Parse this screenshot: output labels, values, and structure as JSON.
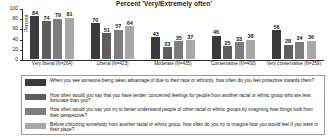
{
  "chart_data": {
    "type": "bar",
    "title": "Percent 'Very/Extremely often'",
    "xlabel": "",
    "ylabel": "Percent",
    "ylim": [
      0,
      100
    ],
    "yticks": [
      0,
      20,
      40,
      60,
      80,
      100
    ],
    "grid": false,
    "legend_position": "bottom",
    "categories": [
      "Very liberal (N=264)",
      "Liberal (N=423)",
      "Moderate (N=435)",
      "Conservative (N=400)",
      "Very conservative (N=259)"
    ],
    "series": [
      {
        "name": "When you see someone being taken advantage of due to their race or ethnicity, how often do you feel protective towards them?",
        "color": "#3b3b3b",
        "values": [
          84,
          70,
          43,
          46,
          56
        ]
      },
      {
        "name": "How often would you say that you have tender, concerned feelings for people from another racial or ethnic group who are less fortunate than you?",
        "color": "#5e5e5e",
        "values": [
          74,
          51,
          23,
          25,
          28
        ]
      },
      {
        "name": "How often would you say you try to better understand people of other racial or ethnic groups by imagining how things look from their perspective?",
        "color": "#7d7d7d",
        "values": [
          79,
          57,
          35,
          33,
          34
        ]
      },
      {
        "name": "Before criticizing somebody from another racial or ethnic group, how often do you try to imagine how you would feel if you were in their place?",
        "color": "#a8a8a8",
        "values": [
          81,
          64,
          37,
          38,
          36
        ]
      }
    ]
  }
}
